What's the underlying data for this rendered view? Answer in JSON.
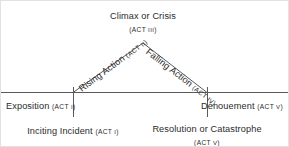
{
  "diagram": {
    "type": "dramatic-structure-pyramid",
    "background_color": "#ffffff",
    "line_color": "#555555",
    "text_color": "#2b2b2b",
    "border_color": "#e2e2e2"
  },
  "labels": {
    "climax": {
      "text": "Climax or Crisis",
      "act_open": "(",
      "act_word": "ACT ",
      "act_numeral": "III",
      "act_close": ")",
      "act_full": "(ACT III)"
    },
    "rising": {
      "text": "Rising Action ",
      "act_open": "(",
      "act_word": "ACT ",
      "act_numeral": "II",
      "act_close": ")",
      "act_full": "(ACT II)"
    },
    "falling": {
      "text": "Falling Action ",
      "act_open": "(",
      "act_word": "ACT ",
      "act_numeral": "IV",
      "act_close": ")",
      "act_full": "(ACT IV)"
    },
    "exposition": {
      "text": "Exposition ",
      "act_open": "(",
      "act_word": "ACT ",
      "act_numeral": "I",
      "act_close": ")",
      "act_full": "(ACT I)"
    },
    "denouement": {
      "text": "Dénouement ",
      "act_open": "(",
      "act_word": "ACT ",
      "act_numeral": "V",
      "act_close": ")",
      "act_full": "(ACT V)"
    },
    "inciting": {
      "text": "Inciting Incident ",
      "act_open": "(",
      "act_word": "ACT ",
      "act_numeral": "I",
      "act_close": ")",
      "act_full": "(ACT I)"
    },
    "resolution": {
      "text": "Resolution or Catastrophe",
      "act_open": "(",
      "act_word": "ACT ",
      "act_numeral": "V",
      "act_close": ")",
      "act_full": "(ACT V)"
    }
  },
  "geometry": {
    "apex_x": 142,
    "apex_y": 42,
    "baseline_y": 91,
    "baseline_x_start": 0,
    "baseline_x_end": 289,
    "rising_foot_x": 72,
    "falling_foot_x": 206,
    "tick_bottom_y": 116
  }
}
